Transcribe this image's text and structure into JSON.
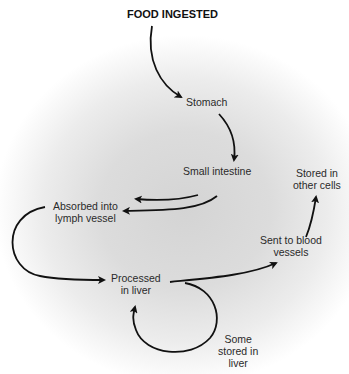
{
  "diagram": {
    "title": "FOOD INGESTED",
    "nodes": {
      "stomach": "Stomach",
      "small_intestine": "Small intestine",
      "absorbed_lymph_1": "Absorbed into",
      "absorbed_lymph_2": "lymph vessel",
      "processed_liver_1": "Processed",
      "processed_liver_2": "in liver",
      "sent_blood_1": "Sent to blood",
      "sent_blood_2": "vessels",
      "stored_cells_1": "Stored in",
      "stored_cells_2": "other cells",
      "stored_liver_1": "Some",
      "stored_liver_2": "stored in",
      "stored_liver_3": "liver"
    },
    "edges": [
      {
        "from": "FOOD INGESTED",
        "to": "Stomach"
      },
      {
        "from": "Stomach",
        "to": "Small intestine"
      },
      {
        "from": "Small intestine",
        "to": "(unlabeled, left)"
      },
      {
        "from": "Small intestine",
        "to": "Absorbed into lymph vessel"
      },
      {
        "from": "Absorbed into lymph vessel",
        "to": "Processed in liver"
      },
      {
        "from": "Processed in liver",
        "to": "Sent to blood vessels"
      },
      {
        "from": "Sent to blood vessels",
        "to": "Stored in other cells"
      },
      {
        "from": "Processed in liver",
        "to": "Processed in liver",
        "label": "Some stored in liver"
      }
    ],
    "colors": {
      "arrow": "#111111",
      "text": "#2a2a2a"
    }
  }
}
